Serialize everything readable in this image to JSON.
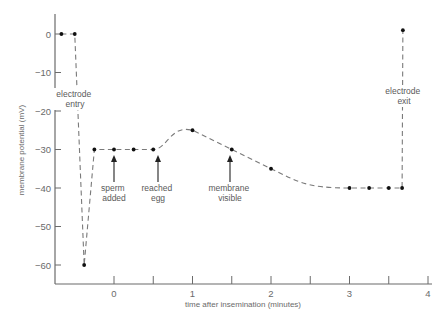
{
  "chart_data": {
    "type": "line",
    "title": "",
    "xlabel": "time after insemination (minutes)",
    "ylabel": "membrane potential (mV)",
    "xlim": [
      -0.75,
      4
    ],
    "ylim": [
      -65,
      5
    ],
    "xticks": [
      0,
      1,
      2,
      3,
      4
    ],
    "xminor_ticks": [
      0.5,
      1.5,
      2.5,
      3.5
    ],
    "yticks": [
      0,
      -10,
      -20,
      -30,
      -40,
      -50,
      -60
    ],
    "xtick_labels": [
      "0",
      "1",
      "2",
      "3",
      "4"
    ],
    "ytick_labels": [
      "0",
      "−10",
      "−20",
      "−30",
      "−40",
      "−50",
      "−60"
    ],
    "grid": false,
    "legend": null,
    "line_style": "dashed",
    "series": [
      {
        "name": "membrane potential",
        "points": [
          {
            "x": -0.67,
            "y": 0
          },
          {
            "x": -0.5,
            "y": 0
          },
          {
            "x": -0.38,
            "y": -60
          },
          {
            "x": -0.25,
            "y": -30
          },
          {
            "x": 0.0,
            "y": -30
          },
          {
            "x": 0.25,
            "y": -30
          },
          {
            "x": 0.5,
            "y": -30
          },
          {
            "x": 1.0,
            "y": -25
          },
          {
            "x": 1.5,
            "y": -30
          },
          {
            "x": 2.0,
            "y": -35
          },
          {
            "x": 3.0,
            "y": -40
          },
          {
            "x": 3.25,
            "y": -40
          },
          {
            "x": 3.5,
            "y": -40
          },
          {
            "x": 3.67,
            "y": -40
          },
          {
            "x": 3.68,
            "y": 1
          }
        ]
      }
    ],
    "annotations": [
      {
        "text": "electrode entry",
        "x": -0.5,
        "y": -15,
        "type": "inline-label"
      },
      {
        "text": "sperm added",
        "x": 0.0,
        "y": -30,
        "type": "arrow"
      },
      {
        "text": "reached egg",
        "x": 0.5,
        "y": -30,
        "type": "arrow"
      },
      {
        "text": "membrane visible",
        "x": 1.5,
        "y": -30,
        "type": "arrow"
      },
      {
        "text": "electrode exit",
        "x": 3.68,
        "y": -15,
        "type": "inline-label"
      }
    ]
  },
  "labels": {
    "xlabel": "time after insemination (minutes)",
    "ylabel": "membrane potential (mV)",
    "electrode_entry": [
      "electrode",
      "entry"
    ],
    "sperm_added": [
      "sperm",
      "added"
    ],
    "reached_egg": [
      "reached",
      "egg"
    ],
    "membrane_visible": [
      "membrane",
      "visible"
    ],
    "electrode_exit": [
      "electrode",
      "exit"
    ]
  }
}
